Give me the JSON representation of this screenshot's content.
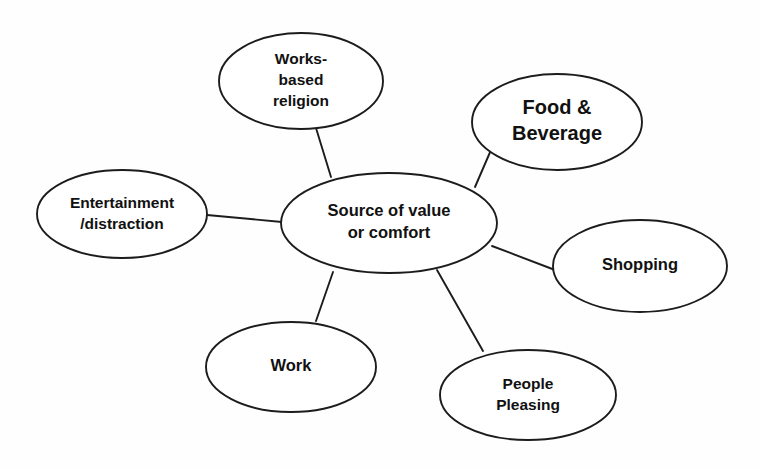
{
  "diagram": {
    "type": "spoke-and-hub mind map",
    "background_color": "#fefefe",
    "stroke_color": "#1c1c1c",
    "fill_color": "#ffffff",
    "center": {
      "id": "source-of-value-or-comfort",
      "lines": [
        "Source of value",
        "or comfort"
      ],
      "cx": 389,
      "cy": 223,
      "rx": 108,
      "ry": 50,
      "font_size": "label-md"
    },
    "nodes": [
      {
        "id": "works-based-religion",
        "lines": [
          "Works-",
          "based",
          "religion"
        ],
        "cx": 301,
        "cy": 81,
        "rx": 82,
        "ry": 48,
        "font_size": "label-sm",
        "connector": {
          "x1": 316,
          "y1": 128,
          "x2": 331,
          "y2": 177
        }
      },
      {
        "id": "food-and-beverage",
        "lines": [
          "Food &",
          "Beverage"
        ],
        "cx": 557,
        "cy": 122,
        "rx": 85,
        "ry": 48,
        "font_size": "label-lg",
        "connector": {
          "x1": 491,
          "y1": 150,
          "x2": 475,
          "y2": 187
        }
      },
      {
        "id": "shopping",
        "lines": [
          "Shopping"
        ],
        "cx": 640,
        "cy": 266,
        "rx": 87,
        "ry": 46,
        "font_size": "label-md",
        "connector": {
          "x1": 492,
          "y1": 246,
          "x2": 555,
          "y2": 270
        }
      },
      {
        "id": "people-pleasing",
        "lines": [
          "People",
          "Pleasing"
        ],
        "cx": 528,
        "cy": 395,
        "rx": 88,
        "ry": 45,
        "font_size": "label-sm",
        "connector": {
          "x1": 437,
          "y1": 270,
          "x2": 483,
          "y2": 351
        }
      },
      {
        "id": "work",
        "lines": [
          "Work"
        ],
        "cx": 291,
        "cy": 367,
        "rx": 85,
        "ry": 45,
        "font_size": "label-md",
        "connector": {
          "x1": 333,
          "y1": 272,
          "x2": 316,
          "y2": 321
        }
      },
      {
        "id": "entertainment-distraction",
        "lines": [
          "Entertainment",
          "/distraction"
        ],
        "cx": 122,
        "cy": 214,
        "rx": 85,
        "ry": 44,
        "font_size": "label-sm",
        "connector": {
          "x1": 207,
          "y1": 215,
          "x2": 282,
          "y2": 222
        }
      }
    ]
  }
}
